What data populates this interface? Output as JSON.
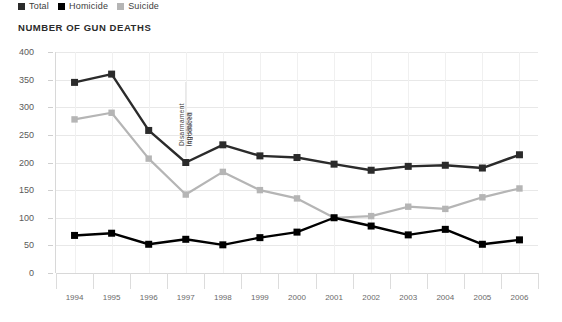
{
  "chart_data": {
    "type": "line",
    "title": "NUMBER OF GUN DEATHS",
    "xlabel": "",
    "ylabel": "",
    "ylim": [
      0,
      400
    ],
    "ytick_step": 50,
    "grid": true,
    "legend_position": "top-left",
    "categories": [
      "1994",
      "1995",
      "1996",
      "1997",
      "1998",
      "1999",
      "2000",
      "2001",
      "2002",
      "2003",
      "2004",
      "2005",
      "2006"
    ],
    "series": [
      {
        "name": "Total",
        "color": "#2b2b2b",
        "values": [
          345,
          360,
          258,
          200,
          232,
          212,
          209,
          197,
          186,
          193,
          195,
          190,
          214
        ]
      },
      {
        "name": "Homicide",
        "color": "#000000",
        "values": [
          68,
          72,
          52,
          61,
          51,
          64,
          74,
          100,
          85,
          69,
          79,
          52,
          60
        ]
      },
      {
        "name": "Suicide",
        "color": "#b5b5b5",
        "values": [
          278,
          290,
          207,
          142,
          183,
          150,
          135,
          100,
          103,
          120,
          116,
          137,
          153
        ]
      }
    ],
    "annotations": [
      {
        "name": "disarmament-legislation-marker",
        "line1": "Disarmament legislation",
        "line2": "introduced",
        "at_category": "1997",
        "rotation": -90
      }
    ],
    "ytick_labels": [
      "0",
      "50",
      "100",
      "150",
      "200",
      "250",
      "300",
      "350",
      "400"
    ]
  },
  "legend": {
    "items": [
      {
        "label": "Total",
        "color": "#2b2b2b"
      },
      {
        "label": "Homicide",
        "color": "#000000"
      },
      {
        "label": "Suicide",
        "color": "#b5b5b5"
      }
    ]
  }
}
